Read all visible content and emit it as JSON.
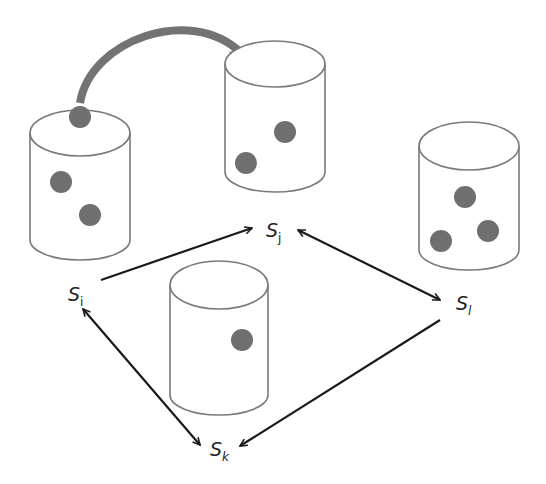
{
  "diagram": {
    "colors": {
      "background": "#ffffff",
      "cylinder_stroke": "#7a7a7a",
      "dot_fill": "#6f6f6f",
      "migration_arrow": "#737373",
      "edge": "#1a1a1a",
      "label": "#222222"
    },
    "nodes": [
      {
        "id": "i",
        "label": "S",
        "subscript": "i",
        "items": 3
      },
      {
        "id": "j",
        "label": "S",
        "subscript": "j",
        "items": 2
      },
      {
        "id": "l",
        "label": "S",
        "subscript": "l",
        "items": 3
      },
      {
        "id": "k",
        "label": "S",
        "subscript": "k",
        "items": 1
      }
    ],
    "edges": [
      {
        "from": "i",
        "to": "j",
        "direction": "one-way"
      },
      {
        "from": "j",
        "to": "l",
        "direction": "bidirectional"
      },
      {
        "from": "i",
        "to": "k",
        "direction": "bidirectional"
      },
      {
        "from": "l",
        "to": "k",
        "direction": "one-way"
      }
    ],
    "migration": {
      "from": "i",
      "to": "j",
      "description": "item moved from store i to store j"
    }
  }
}
